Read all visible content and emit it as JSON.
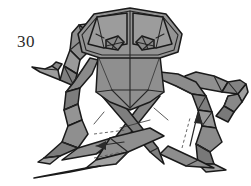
{
  "figure": {
    "step_label": "30",
    "colors": {
      "background": "#ffffff",
      "paper_light": "#a8a8a8",
      "paper_mid": "#8e8e8e",
      "paper_dark": "#7a7a7a",
      "paper_darker": "#6b6b6b",
      "paper_shadow": "#5e5e5e",
      "outline": "#1a1a1a",
      "crease": "#262626",
      "text": "#2b2b2b"
    },
    "arrows": [
      {
        "name": "fold-arrow-left",
        "direction": "left"
      },
      {
        "name": "fold-arrow-up-right",
        "direction": "up"
      }
    ],
    "details": {
      "eye_left": "eye-crease-left",
      "eye_right": "eye-crease-right",
      "head": "hexagonal-head-panel",
      "legs_left": 3,
      "legs_right": 3
    }
  }
}
